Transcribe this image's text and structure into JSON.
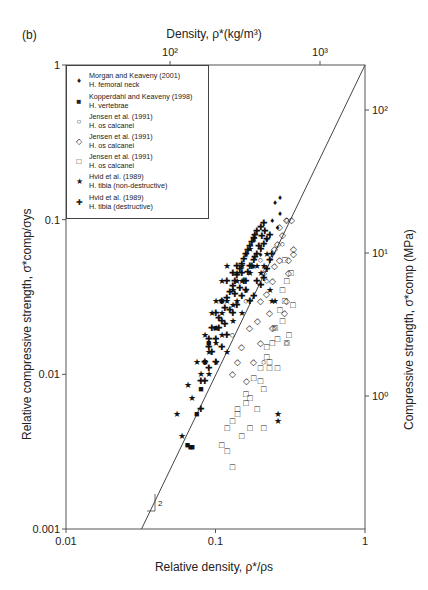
{
  "panel_label": "(b)",
  "chart_data": {
    "type": "scatter",
    "title": "",
    "top_axis": {
      "label": "Density, ρ*(kg/m³)",
      "ticks": [
        "10²",
        "10³"
      ],
      "tick_values": [
        100,
        1000
      ]
    },
    "xlabel": "Relative density, ρ*/ρs",
    "ylabel": "Relative compressive strength, σ*comp/σys",
    "right_axis": {
      "label": "Compressive strength, σ*comp (MPa)",
      "ticks": [
        "10²",
        "10¹",
        "10⁰"
      ],
      "tick_values": [
        100,
        10,
        1
      ]
    },
    "xscale": "log",
    "yscale": "log",
    "xlim": [
      0.01,
      1
    ],
    "ylim": [
      0.001,
      1
    ],
    "x_ticks": [
      "0.01",
      "0.1",
      "1"
    ],
    "y_ticks": [
      "1",
      "0.1",
      "0.01",
      "0.001"
    ],
    "grid": false,
    "legend_position": "upper left",
    "trend_line": {
      "slope": 2,
      "points": [
        [
          0.032,
          0.001
        ],
        [
          1,
          1
        ]
      ],
      "slope_label": "2"
    },
    "legend": [
      {
        "symbol": "small-filled-diamond",
        "glyph": "♦",
        "line1": "Morgan and Keaveny (2001)",
        "line2": "H. femoral neck"
      },
      {
        "symbol": "filled-square",
        "glyph": "■",
        "line1": "Kopperdahl and Keaveny (1998)",
        "line2": "H. vertebrae"
      },
      {
        "symbol": "open-circle",
        "glyph": "○",
        "line1": "Jensen et al. (1991)",
        "line2": "H. os calcanei"
      },
      {
        "symbol": "open-diamond",
        "glyph": "◇",
        "line1": "Jensen et al. (1991)",
        "line2": "H. os calcanei"
      },
      {
        "symbol": "open-square",
        "glyph": "□",
        "line1": "Jensen et al. (1991)",
        "line2": "H. os calcanei"
      },
      {
        "symbol": "filled-star",
        "glyph": "★",
        "line1": "Hvid et al. (1989)",
        "line2": "H. tibia (non-destructive)"
      },
      {
        "symbol": "filled-cross",
        "glyph": "✚",
        "line1": "Hvid et al. (1989)",
        "line2": "H. tibia (destructive)"
      }
    ],
    "series": [
      {
        "name": "Morgan and Keaveny (2001) H. femoral neck",
        "glyph": "♦",
        "points": [
          [
            0.25,
            0.13
          ],
          [
            0.27,
            0.14
          ],
          [
            0.24,
            0.1
          ],
          [
            0.26,
            0.09
          ],
          [
            0.22,
            0.075
          ],
          [
            0.27,
            0.11
          ],
          [
            0.2,
            0.06
          ],
          [
            0.18,
            0.05
          ]
        ]
      },
      {
        "name": "Kopperdahl and Keaveny (1998) H. vertebrae",
        "glyph": "■",
        "points": [
          [
            0.065,
            0.0035
          ],
          [
            0.068,
            0.0034
          ],
          [
            0.07,
            0.0034
          ],
          [
            0.075,
            0.0055
          ],
          [
            0.085,
            0.012
          ],
          [
            0.09,
            0.016
          ],
          [
            0.1,
            0.02
          ],
          [
            0.11,
            0.03
          ],
          [
            0.08,
            0.008
          ]
        ]
      },
      {
        "name": "Jensen et al. (1991) circles",
        "glyph": "○",
        "points": [
          [
            0.2,
            0.055
          ],
          [
            0.3,
            0.1
          ],
          [
            0.25,
            0.02
          ],
          [
            0.21,
            0.012
          ],
          [
            0.3,
            0.016
          ],
          [
            0.16,
            0.03
          ],
          [
            0.13,
            0.018
          ],
          [
            0.22,
            0.04
          ],
          [
            0.28,
            0.07
          ]
        ]
      },
      {
        "name": "Jensen et al. (1991) diamonds",
        "glyph": "◇",
        "points": [
          [
            0.3,
            0.1
          ],
          [
            0.32,
            0.1
          ],
          [
            0.33,
            0.06
          ],
          [
            0.31,
            0.045
          ],
          [
            0.28,
            0.08
          ],
          [
            0.26,
            0.07
          ],
          [
            0.25,
            0.05
          ],
          [
            0.24,
            0.04
          ],
          [
            0.22,
            0.033
          ],
          [
            0.2,
            0.03
          ],
          [
            0.19,
            0.022
          ],
          [
            0.17,
            0.02
          ],
          [
            0.15,
            0.015
          ],
          [
            0.23,
            0.025
          ],
          [
            0.27,
            0.055
          ],
          [
            0.3,
            0.03
          ],
          [
            0.29,
            0.025
          ],
          [
            0.14,
            0.012
          ],
          [
            0.16,
            0.009
          ],
          [
            0.18,
            0.012
          ],
          [
            0.21,
            0.045
          ],
          [
            0.25,
            0.065
          ],
          [
            0.27,
            0.09
          ],
          [
            0.33,
            0.065
          ],
          [
            0.31,
            0.055
          ],
          [
            0.2,
            0.016
          ],
          [
            0.13,
            0.01
          ],
          [
            0.24,
            0.02
          ]
        ]
      },
      {
        "name": "Jensen et al. (1991) squares",
        "glyph": "□",
        "points": [
          [
            0.3,
            0.04
          ],
          [
            0.28,
            0.022
          ],
          [
            0.33,
            0.028
          ],
          [
            0.26,
            0.017
          ],
          [
            0.22,
            0.013
          ],
          [
            0.2,
            0.011
          ],
          [
            0.18,
            0.0095
          ],
          [
            0.16,
            0.0075
          ],
          [
            0.14,
            0.006
          ],
          [
            0.13,
            0.005
          ],
          [
            0.15,
            0.004
          ],
          [
            0.12,
            0.0032
          ],
          [
            0.13,
            0.0025
          ],
          [
            0.21,
            0.0045
          ],
          [
            0.24,
            0.016
          ],
          [
            0.23,
            0.012
          ],
          [
            0.2,
            0.009
          ],
          [
            0.17,
            0.007
          ],
          [
            0.19,
            0.006
          ],
          [
            0.25,
            0.02
          ],
          [
            0.27,
            0.026
          ],
          [
            0.29,
            0.03
          ],
          [
            0.32,
            0.045
          ],
          [
            0.31,
            0.018
          ],
          [
            0.26,
            0.011
          ],
          [
            0.21,
            0.008
          ],
          [
            0.3,
            0.016
          ],
          [
            0.17,
            0.0045
          ],
          [
            0.14,
            0.0055
          ],
          [
            0.16,
            0.0065
          ],
          [
            0.11,
            0.0035
          ],
          [
            0.12,
            0.0045
          ],
          [
            0.22,
            0.015
          ],
          [
            0.28,
            0.035
          ],
          [
            0.23,
            0.011
          ],
          [
            0.29,
            0.055
          ]
        ]
      },
      {
        "name": "Hvid et al. (1989) H. tibia (non-destructive)",
        "glyph": "★",
        "points": [
          [
            0.055,
            0.0055
          ],
          [
            0.06,
            0.004
          ],
          [
            0.07,
            0.007
          ],
          [
            0.08,
            0.01
          ],
          [
            0.09,
            0.014
          ],
          [
            0.1,
            0.02
          ],
          [
            0.11,
            0.025
          ],
          [
            0.12,
            0.03
          ],
          [
            0.13,
            0.035
          ],
          [
            0.14,
            0.045
          ],
          [
            0.15,
            0.05
          ],
          [
            0.16,
            0.06
          ],
          [
            0.17,
            0.065
          ],
          [
            0.18,
            0.075
          ],
          [
            0.12,
            0.05
          ],
          [
            0.11,
            0.04
          ],
          [
            0.1,
            0.03
          ],
          [
            0.095,
            0.025
          ],
          [
            0.085,
            0.018
          ],
          [
            0.075,
            0.012
          ],
          [
            0.065,
            0.0085
          ],
          [
            0.1,
            0.012
          ],
          [
            0.12,
            0.014
          ],
          [
            0.13,
            0.022
          ],
          [
            0.14,
            0.03
          ],
          [
            0.15,
            0.025
          ],
          [
            0.16,
            0.035
          ],
          [
            0.17,
            0.045
          ],
          [
            0.19,
            0.05
          ],
          [
            0.2,
            0.045
          ],
          [
            0.21,
            0.05
          ],
          [
            0.22,
            0.06
          ],
          [
            0.23,
            0.035
          ],
          [
            0.24,
            0.03
          ],
          [
            0.25,
            0.03
          ],
          [
            0.26,
            0.005
          ],
          [
            0.26,
            0.0055
          ],
          [
            0.09,
            0.01
          ],
          [
            0.1,
            0.016
          ],
          [
            0.11,
            0.018
          ],
          [
            0.14,
            0.04
          ],
          [
            0.15,
            0.04
          ],
          [
            0.13,
            0.028
          ]
        ]
      },
      {
        "name": "Hvid et al. (1989) H. tibia (destructive)",
        "glyph": "✚",
        "points": [
          [
            0.08,
            0.006
          ],
          [
            0.085,
            0.009
          ],
          [
            0.09,
            0.011
          ],
          [
            0.095,
            0.014
          ],
          [
            0.1,
            0.017
          ],
          [
            0.105,
            0.02
          ],
          [
            0.11,
            0.022
          ],
          [
            0.115,
            0.027
          ],
          [
            0.12,
            0.031
          ],
          [
            0.125,
            0.034
          ],
          [
            0.13,
            0.037
          ],
          [
            0.135,
            0.04
          ],
          [
            0.14,
            0.044
          ],
          [
            0.145,
            0.048
          ],
          [
            0.15,
            0.052
          ],
          [
            0.155,
            0.056
          ],
          [
            0.16,
            0.06
          ],
          [
            0.165,
            0.064
          ],
          [
            0.17,
            0.068
          ],
          [
            0.175,
            0.072
          ],
          [
            0.18,
            0.076
          ],
          [
            0.185,
            0.08
          ],
          [
            0.19,
            0.085
          ],
          [
            0.2,
            0.09
          ],
          [
            0.21,
            0.095
          ],
          [
            0.09,
            0.017
          ],
          [
            0.1,
            0.025
          ],
          [
            0.11,
            0.03
          ],
          [
            0.12,
            0.04
          ],
          [
            0.13,
            0.045
          ],
          [
            0.14,
            0.05
          ],
          [
            0.15,
            0.045
          ],
          [
            0.16,
            0.04
          ],
          [
            0.17,
            0.05
          ],
          [
            0.18,
            0.055
          ],
          [
            0.19,
            0.06
          ],
          [
            0.2,
            0.065
          ],
          [
            0.21,
            0.07
          ],
          [
            0.22,
            0.075
          ],
          [
            0.23,
            0.08
          ],
          [
            0.1,
            0.012
          ],
          [
            0.11,
            0.015
          ],
          [
            0.12,
            0.018
          ],
          [
            0.13,
            0.025
          ],
          [
            0.14,
            0.028
          ],
          [
            0.15,
            0.032
          ],
          [
            0.16,
            0.035
          ],
          [
            0.17,
            0.03
          ],
          [
            0.18,
            0.032
          ],
          [
            0.19,
            0.04
          ],
          [
            0.2,
            0.038
          ],
          [
            0.21,
            0.042
          ],
          [
            0.22,
            0.048
          ],
          [
            0.23,
            0.055
          ],
          [
            0.24,
            0.06
          ],
          [
            0.08,
            0.009
          ],
          [
            0.085,
            0.012
          ],
          [
            0.09,
            0.015
          ],
          [
            0.095,
            0.02
          ],
          [
            0.105,
            0.023
          ],
          [
            0.115,
            0.021
          ],
          [
            0.125,
            0.026
          ],
          [
            0.135,
            0.033
          ],
          [
            0.145,
            0.036
          ],
          [
            0.155,
            0.04
          ],
          [
            0.165,
            0.046
          ],
          [
            0.175,
            0.05
          ],
          [
            0.185,
            0.057
          ],
          [
            0.195,
            0.068
          ],
          [
            0.205,
            0.078
          ],
          [
            0.215,
            0.085
          ]
        ]
      }
    ]
  }
}
